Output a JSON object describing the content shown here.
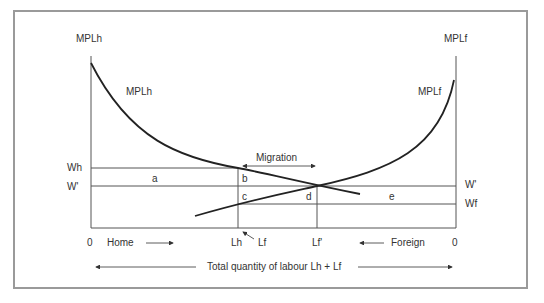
{
  "diagram": {
    "left_axis_title": "MPLh",
    "right_axis_title": "MPLf",
    "curve_home_label": "MPLh",
    "curve_foreign_label": "MPLf",
    "wage_labels": {
      "wh": "Wh",
      "w_prime_left": "W'",
      "w_prime_right": "W'",
      "wf": "Wf"
    },
    "areas": {
      "a": "a",
      "b": "b",
      "c": "c",
      "d": "d",
      "e": "e"
    },
    "migration_label": "Migration",
    "x_labels": {
      "origin_home": "0",
      "home": "Home",
      "lh": "Lh",
      "lf": "Lf",
      "lf_prime": "Lf'",
      "foreign": "Foreign",
      "origin_foreign": "0"
    },
    "total_label": "Total quantity of labour Lh + Lf",
    "colors": {
      "curve": "#222222",
      "line": "#555555",
      "frame": "#9a9a9a"
    }
  }
}
